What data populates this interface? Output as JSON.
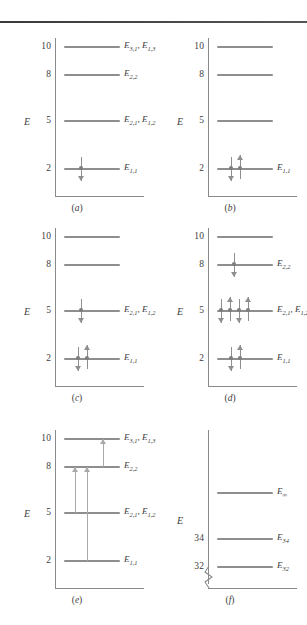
{
  "figure": {
    "axis_label": "E",
    "level_color": "#8e8e8e",
    "axis_color": "#8a8a8a",
    "arrow_color": "#8e8e8e",
    "transition_color": "#a9a9a9"
  },
  "panels": [
    {
      "id": "a",
      "caption": "(a)",
      "axis_label": "E",
      "ticks": [
        "10",
        "8",
        "5",
        "2"
      ],
      "levels": [
        {
          "tick": "10",
          "label": "E",
          "sub": "3,1",
          "label2": "E",
          "sub2": "1,3",
          "text": "E3,1, E1,3"
        },
        {
          "tick": "8",
          "label": "E",
          "sub": "2,2",
          "text": "E2,2"
        },
        {
          "tick": "5",
          "label": "E",
          "sub": "2,1",
          "label2": "E",
          "sub2": "1,2",
          "text": "E2,1, E1,2"
        },
        {
          "tick": "2",
          "label": "E",
          "sub": "1,1",
          "text": "E1,1"
        }
      ],
      "electrons": [
        {
          "tick": "2",
          "spins": [
            "down"
          ]
        }
      ],
      "transitions": []
    },
    {
      "id": "b",
      "caption": "(b)",
      "axis_label": "E",
      "ticks": [
        "10",
        "8",
        "5",
        "2"
      ],
      "levels": [
        {
          "tick": "10",
          "text": ""
        },
        {
          "tick": "8",
          "text": ""
        },
        {
          "tick": "5",
          "text": ""
        },
        {
          "tick": "2",
          "label": "E",
          "sub": "1,1",
          "text": "E1,1"
        }
      ],
      "electrons": [
        {
          "tick": "2",
          "spins": [
            "down",
            "up"
          ]
        }
      ],
      "transitions": []
    },
    {
      "id": "c",
      "caption": "(c)",
      "axis_label": "E",
      "ticks": [
        "10",
        "8",
        "5",
        "2"
      ],
      "levels": [
        {
          "tick": "10",
          "text": ""
        },
        {
          "tick": "8",
          "text": ""
        },
        {
          "tick": "5",
          "label": "E",
          "sub": "2,1",
          "label2": "E",
          "sub2": "1,2",
          "text": "E2,1, E1,2"
        },
        {
          "tick": "2",
          "label": "E",
          "sub": "1,1",
          "text": "E1,1"
        }
      ],
      "electrons": [
        {
          "tick": "5",
          "spins": [
            "down"
          ]
        },
        {
          "tick": "2",
          "spins": [
            "down",
            "up"
          ]
        }
      ],
      "transitions": []
    },
    {
      "id": "d",
      "caption": "(d)",
      "axis_label": "E",
      "ticks": [
        "10",
        "8",
        "5",
        "2"
      ],
      "levels": [
        {
          "tick": "10",
          "text": ""
        },
        {
          "tick": "8",
          "label": "E",
          "sub": "2,2",
          "text": "E2,2"
        },
        {
          "tick": "5",
          "label": "E",
          "sub": "2,1",
          "label2": "E",
          "sub2": "1,2",
          "text": "E2,1, E1,2"
        },
        {
          "tick": "2",
          "label": "E",
          "sub": "1,1",
          "text": "E1,1"
        }
      ],
      "electrons": [
        {
          "tick": "8",
          "spins": [
            "down"
          ]
        },
        {
          "tick": "5",
          "spins": [
            "down",
            "up",
            "down",
            "up"
          ]
        },
        {
          "tick": "2",
          "spins": [
            "down",
            "up"
          ]
        }
      ],
      "transitions": []
    },
    {
      "id": "e",
      "caption": "(e)",
      "axis_label": "E",
      "ticks": [
        "10",
        "8",
        "5",
        "2"
      ],
      "levels": [
        {
          "tick": "10",
          "label": "E",
          "sub": "3,1",
          "label2": "E",
          "sub2": "1,3",
          "text": "E3,1, E1,3"
        },
        {
          "tick": "8",
          "label": "E",
          "sub": "2,2",
          "text": "E2,2"
        },
        {
          "tick": "5",
          "label": "E",
          "sub": "2,1",
          "label2": "E",
          "sub2": "1,2",
          "text": "E2,1, E1,2"
        },
        {
          "tick": "2",
          "label": "E",
          "sub": "1,1",
          "text": "E1,1"
        }
      ],
      "electrons": [],
      "transitions": [
        {
          "from": "8",
          "to": "10",
          "offset": 36
        },
        {
          "from": "5",
          "to": "8",
          "offset": 8
        },
        {
          "from": "2",
          "to": "8",
          "offset": 20
        }
      ]
    },
    {
      "id": "f",
      "caption": "(f)",
      "axis_label": "E",
      "ticks": [
        "34",
        "32"
      ],
      "broken_axis": true,
      "levels": [
        {
          "tick": "",
          "label": "E",
          "sub": "∞",
          "text": "E∞"
        },
        {
          "tick": "34",
          "label": "E",
          "sub": "34",
          "text": "E34"
        },
        {
          "tick": "32",
          "label": "E",
          "sub": "32",
          "text": "E32"
        }
      ],
      "electrons": [],
      "transitions": []
    }
  ]
}
